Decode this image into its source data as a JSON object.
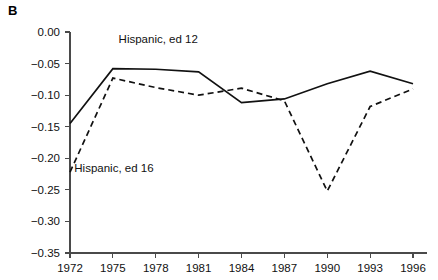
{
  "panel": {
    "label": "B"
  },
  "chart_data": {
    "type": "line",
    "title": "",
    "subtitle": "",
    "xlabel": "",
    "ylabel": "",
    "x": [
      1972,
      1975,
      1978,
      1981,
      1984,
      1987,
      1990,
      1993,
      1996
    ],
    "categories": [
      "1972",
      "1975",
      "1978",
      "1981",
      "1984",
      "1987",
      "1990",
      "1993",
      "1996"
    ],
    "xlim": [
      1972,
      1996
    ],
    "ylim": [
      -0.35,
      0.0
    ],
    "yticks": [
      0.0,
      -0.05,
      -0.1,
      -0.15,
      -0.2,
      -0.25,
      -0.3,
      -0.35
    ],
    "ytick_labels": [
      "0.00",
      "−0.05",
      "−0.10",
      "−0.15",
      "−0.20",
      "−0.25",
      "−0.30",
      "−0.35"
    ],
    "xticks": [
      1972,
      1975,
      1978,
      1981,
      1984,
      1987,
      1990,
      1993,
      1996
    ],
    "xtick_labels": [
      "1972",
      "1975",
      "1978",
      "1981",
      "1984",
      "1987",
      "1990",
      "1993",
      "1996"
    ],
    "grid": false,
    "legend_position": "inline-annotation",
    "series": [
      {
        "name": "Hispanic, ed 12",
        "style": "solid",
        "color": "#111111",
        "label_x": 1975.4,
        "label_y": -0.018,
        "values": [
          -0.145,
          -0.058,
          -0.059,
          -0.063,
          -0.112,
          -0.106,
          -0.082,
          -0.062,
          -0.082
        ]
      },
      {
        "name": "Hispanic, ed 16",
        "style": "dashed",
        "color": "#111111",
        "label_x": 1972.3,
        "label_y": -0.221,
        "values": [
          -0.222,
          -0.073,
          -0.088,
          -0.1,
          -0.089,
          -0.109,
          -0.252,
          -0.118,
          -0.09
        ]
      }
    ]
  }
}
